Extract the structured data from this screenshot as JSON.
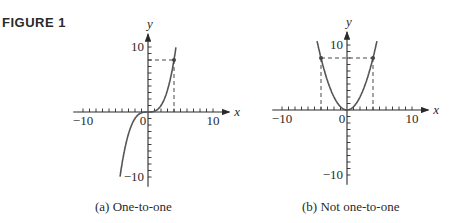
{
  "figure_label": "FIGURE 1",
  "chart_data": [
    {
      "type": "line",
      "title": "(a) One-to-one",
      "function": "y = x^3 / 8 (cubic)",
      "xlabel": "x",
      "ylabel": "y",
      "xlim": [
        -12,
        12
      ],
      "ylim": [
        -12,
        12
      ],
      "x_tick_labels": [
        "-10",
        "0",
        "10"
      ],
      "y_tick_labels": [
        "10",
        "-10"
      ],
      "points": [
        [
          -4.3,
          -10
        ],
        [
          -3,
          -3.4
        ],
        [
          -2,
          -1
        ],
        [
          0,
          0
        ],
        [
          2,
          1
        ],
        [
          3,
          3.4
        ],
        [
          4,
          8
        ],
        [
          4.3,
          10
        ]
      ],
      "highlight": {
        "x": 4,
        "y": 8,
        "dashed_guides": true
      }
    },
    {
      "type": "line",
      "title": "(b) Not one-to-one",
      "function": "y = x^2 / 2 (parabola)",
      "xlabel": "x",
      "ylabel": "y",
      "xlim": [
        -12,
        12
      ],
      "ylim": [
        -12,
        12
      ],
      "x_tick_labels": [
        "-10",
        "0",
        "10"
      ],
      "y_tick_labels": [
        "10",
        "-10"
      ],
      "points": [
        [
          -4.5,
          10
        ],
        [
          -4,
          8
        ],
        [
          -2,
          2
        ],
        [
          0,
          0
        ],
        [
          2,
          2
        ],
        [
          4,
          8
        ],
        [
          4.5,
          10
        ]
      ],
      "highlight": [
        {
          "x": -4,
          "y": 8
        },
        {
          "x": 4,
          "y": 8
        }
      ],
      "dashed_guides": true
    }
  ],
  "labels": {
    "x": "x",
    "y": "y",
    "ten": "10",
    "neg_ten": "−10",
    "zero": "0"
  },
  "captions": {
    "a": "(a)  One-to-one",
    "b": "(b)  Not one-to-one"
  }
}
